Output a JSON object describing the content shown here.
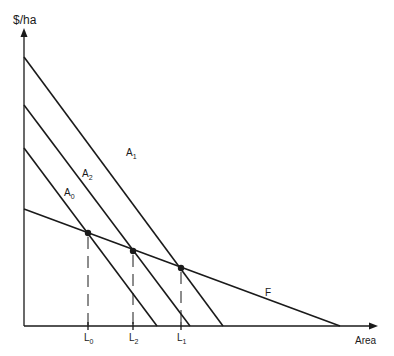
{
  "diagram": {
    "y_axis_label": "$/ha",
    "x_axis_label": "Area",
    "colors": {
      "line": "#1a1a1a",
      "background": "#ffffff"
    },
    "curves": [
      {
        "id": "A1",
        "label": "A",
        "sub": "1",
        "x1": 24,
        "y1": 57,
        "x2": 223,
        "y2": 326,
        "lx": 126,
        "ly": 156
      },
      {
        "id": "A2",
        "label": "A",
        "sub": "2",
        "x1": 24,
        "y1": 105,
        "x2": 190,
        "y2": 326,
        "lx": 82,
        "ly": 177
      },
      {
        "id": "A0",
        "label": "A",
        "sub": "0",
        "x1": 24,
        "y1": 148,
        "x2": 157,
        "y2": 326,
        "lx": 64,
        "ly": 196
      },
      {
        "id": "F",
        "label": "F",
        "sub": "",
        "x1": 24,
        "y1": 209,
        "x2": 340,
        "y2": 326,
        "lx": 265,
        "ly": 296
      }
    ],
    "intersections": [
      {
        "id": "L0",
        "x": 88,
        "y": 233,
        "label": "L",
        "sub": "0"
      },
      {
        "id": "L2",
        "x": 133,
        "y": 251,
        "label": "L",
        "sub": "2"
      },
      {
        "id": "L1",
        "x": 181,
        "y": 268,
        "label": "L",
        "sub": "1"
      }
    ]
  }
}
